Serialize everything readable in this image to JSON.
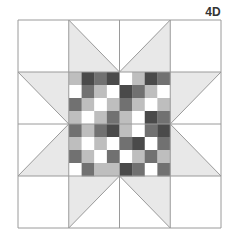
{
  "label": "4D",
  "colors": {
    "dark": "#4a4a4a",
    "mid": "#717171",
    "light": "#bebebe",
    "white": "#ffffff",
    "triangle": "#e8e8e8",
    "line": "#9a9a9a"
  },
  "frame": {
    "x": 18,
    "y": 20,
    "w": 203,
    "h": 208,
    "cols": 4,
    "rows": 4
  },
  "checker": {
    "x": 69,
    "y": 72,
    "w": 101,
    "h": 104,
    "cols": 8,
    "rows": 8,
    "cells": [
      [
        "light",
        "dark",
        "mid",
        "dark",
        "white",
        "light",
        "dark",
        "mid"
      ],
      [
        "white",
        "mid",
        "light",
        "white",
        "dark",
        "mid",
        "light",
        "white"
      ],
      [
        "mid",
        "light",
        "white",
        "light",
        "mid",
        "light",
        "white",
        "light"
      ],
      [
        "light",
        "white",
        "light",
        "mid",
        "light",
        "white",
        "dark",
        "mid"
      ],
      [
        "mid",
        "light",
        "mid",
        "dark",
        "light",
        "white",
        "mid",
        "dark"
      ],
      [
        "light",
        "white",
        "light",
        "white",
        "mid",
        "dark",
        "white",
        "mid"
      ],
      [
        "mid",
        "light",
        "white",
        "mid",
        "white",
        "light",
        "mid",
        "light"
      ],
      [
        "white",
        "mid",
        "light",
        "light",
        "dark",
        "mid",
        "white",
        "mid"
      ]
    ]
  }
}
